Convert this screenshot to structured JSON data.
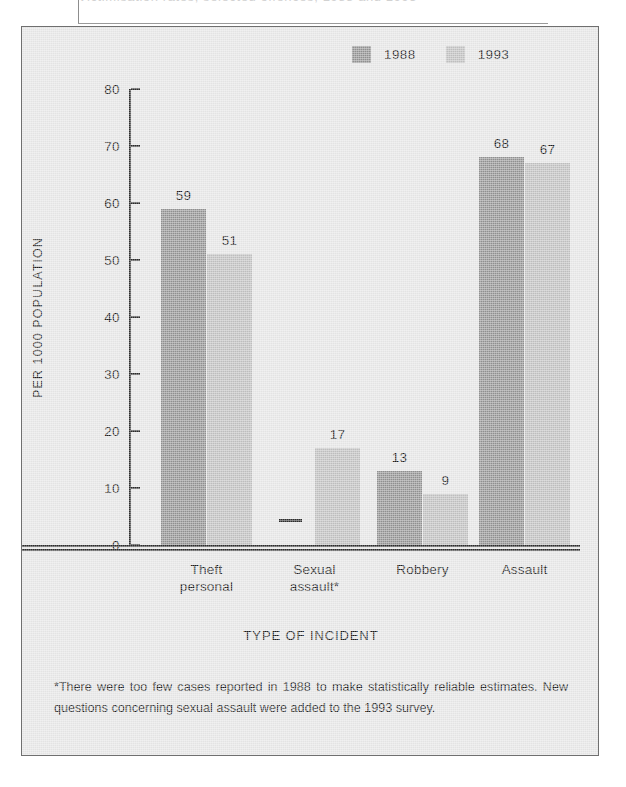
{
  "top_cut_text": "Victimisation rates, selected offences, 1988 and 1993",
  "legend": {
    "entries": [
      {
        "label": "1988",
        "color": "#8f8f8f",
        "name": "legend-1988"
      },
      {
        "label": "1993",
        "color": "#bdbdbd",
        "name": "legend-1993"
      }
    ]
  },
  "axis": {
    "ylabel": "PER 1000 POPULATION",
    "xlabel": "TYPE OF INCIDENT",
    "yticks": [
      0,
      10,
      20,
      30,
      40,
      50,
      60,
      70,
      80
    ]
  },
  "footnote": "*There were too few cases reported in 1988 to make statistically reliable estimates. New questions concerning sexual assault were added to the 1993 survey.",
  "nodata_marker": "—",
  "chart_data": {
    "type": "bar",
    "title": "",
    "xlabel": "TYPE OF INCIDENT",
    "ylabel": "PER 1000 POPULATION",
    "ylim": [
      0,
      80
    ],
    "ytick_step": 10,
    "grid": false,
    "legend_position": "top-right",
    "categories": [
      "Theft personal",
      "Sexual assault*",
      "Robbery",
      "Assault"
    ],
    "category_lines": [
      [
        "Theft",
        "personal"
      ],
      [
        "Sexual",
        "assault*"
      ],
      [
        "Robbery",
        ""
      ],
      [
        "Assault",
        ""
      ]
    ],
    "series": [
      {
        "name": "1988",
        "color": "#8f8f8f",
        "values": [
          59,
          null,
          13,
          68
        ],
        "labels": [
          "59",
          "—",
          "13",
          "68"
        ]
      },
      {
        "name": "1993",
        "color": "#bdbdbd",
        "values": [
          51,
          17,
          9,
          67
        ],
        "labels": [
          "51",
          "17",
          "9",
          "67"
        ]
      }
    ]
  }
}
